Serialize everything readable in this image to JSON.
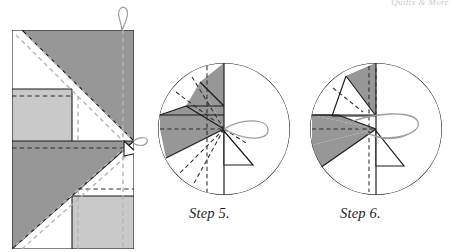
{
  "page": {
    "width": 457,
    "height": 252,
    "background": "#ffffff",
    "running_head": "Quilts & More"
  },
  "colors": {
    "dark_gray": "#979797",
    "light_gray": "#c9c9c9",
    "white": "#ffffff",
    "outline": "#1a1a1a",
    "dashed_dark": "#2b2b2b",
    "dashed_light": "#b0b0b0",
    "thread": "#9d9d9d",
    "caption_text": "#1b1b1b"
  },
  "figures": [
    {
      "id": "folded-square",
      "name": "folded-fabric-square",
      "type": "square-fold-diagram",
      "label": "",
      "bounds": {
        "x": 12,
        "y": 30,
        "width": 122,
        "height": 219
      },
      "description": "Folded fabric rectangle with dark gray pinwheel triangles, light gray panels and dashed fold lines",
      "thread_loops": 2
    },
    {
      "id": "step5",
      "name": "circle-step-5",
      "type": "circle-fold-diagram",
      "label": "Step 5.",
      "center": {
        "x": 224,
        "y": 129
      },
      "radius": 66,
      "description": "Circle containing gathered folded square with needle and thread at right"
    },
    {
      "id": "step6",
      "name": "circle-step-6",
      "type": "circle-fold-diagram",
      "label": "Step 6.",
      "center": {
        "x": 376,
        "y": 129
      },
      "radius": 66,
      "description": "Circle containing gathered folded square with longer thread pulled to the right"
    }
  ],
  "captions": {
    "step5": "Step 5.",
    "step6": "Step 6."
  }
}
